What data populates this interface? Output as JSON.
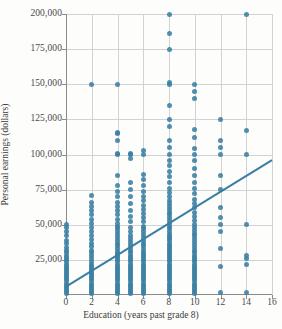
{
  "chart_data": {
    "type": "scatter",
    "title": "",
    "xlabel": "Education (years past grade 8)",
    "ylabel": "Personal earnings (dollars)",
    "xlim": [
      0,
      16
    ],
    "ylim": [
      0,
      200000
    ],
    "xticks": [
      0,
      2,
      4,
      6,
      8,
      10,
      12,
      14,
      16
    ],
    "xticklabels": [
      "0",
      "2",
      "4",
      "6",
      "8",
      "10",
      "12",
      "14",
      "16"
    ],
    "yticks": [
      25000,
      50000,
      75000,
      100000,
      125000,
      150000,
      175000,
      200000
    ],
    "yticklabels": [
      "25,000",
      "50,000",
      "75,000",
      "100,000",
      "125,000",
      "150,000",
      "175,000",
      "200,000"
    ],
    "grid": true,
    "legend": false,
    "marker_color": "#3a7fa3",
    "trendline_color": "#3a7fa3",
    "trendline": {
      "x_start": 0,
      "y_start": 6000,
      "x_end": 16,
      "y_end": 96000
    },
    "series": [
      {
        "name": "Personal earnings vs education",
        "points": [
          [
            0,
            1000
          ],
          [
            0,
            2500
          ],
          [
            0,
            4000
          ],
          [
            0,
            5500
          ],
          [
            0,
            7000
          ],
          [
            0,
            8500
          ],
          [
            0,
            10000
          ],
          [
            0,
            11500
          ],
          [
            0,
            13000
          ],
          [
            0,
            14500
          ],
          [
            0,
            16000
          ],
          [
            0,
            17500
          ],
          [
            0,
            19000
          ],
          [
            0,
            20500
          ],
          [
            0,
            22000
          ],
          [
            0,
            23500
          ],
          [
            0,
            25000
          ],
          [
            0,
            26500
          ],
          [
            0,
            28000
          ],
          [
            0,
            30000
          ],
          [
            0,
            32000
          ],
          [
            0,
            34000
          ],
          [
            0,
            36500
          ],
          [
            0,
            39000
          ],
          [
            0,
            42000
          ],
          [
            0,
            45000
          ],
          [
            0,
            48000
          ],
          [
            0,
            50000
          ],
          [
            2,
            1000
          ],
          [
            2,
            2500
          ],
          [
            2,
            4000
          ],
          [
            2,
            5500
          ],
          [
            2,
            7000
          ],
          [
            2,
            8500
          ],
          [
            2,
            10000
          ],
          [
            2,
            11500
          ],
          [
            2,
            13000
          ],
          [
            2,
            14500
          ],
          [
            2,
            16000
          ],
          [
            2,
            17500
          ],
          [
            2,
            19000
          ],
          [
            2,
            20500
          ],
          [
            2,
            22000
          ],
          [
            2,
            24000
          ],
          [
            2,
            26000
          ],
          [
            2,
            28000
          ],
          [
            2,
            30000
          ],
          [
            2,
            32000
          ],
          [
            2,
            34500
          ],
          [
            2,
            37000
          ],
          [
            2,
            39500
          ],
          [
            2,
            42000
          ],
          [
            2,
            45000
          ],
          [
            2,
            48000
          ],
          [
            2,
            51000
          ],
          [
            2,
            54000
          ],
          [
            2,
            57000
          ],
          [
            2,
            60000
          ],
          [
            2,
            63000
          ],
          [
            2,
            66000
          ],
          [
            2,
            71000
          ],
          [
            2,
            150000
          ],
          [
            4,
            1000
          ],
          [
            4,
            2500
          ],
          [
            4,
            4000
          ],
          [
            4,
            5500
          ],
          [
            4,
            7000
          ],
          [
            4,
            8500
          ],
          [
            4,
            10000
          ],
          [
            4,
            11500
          ],
          [
            4,
            13000
          ],
          [
            4,
            14500
          ],
          [
            4,
            16000
          ],
          [
            4,
            17500
          ],
          [
            4,
            19000
          ],
          [
            4,
            20500
          ],
          [
            4,
            22000
          ],
          [
            4,
            23500
          ],
          [
            4,
            25000
          ],
          [
            4,
            26500
          ],
          [
            4,
            28000
          ],
          [
            4,
            29500
          ],
          [
            4,
            31000
          ],
          [
            4,
            33000
          ],
          [
            4,
            35000
          ],
          [
            4,
            37000
          ],
          [
            4,
            39000
          ],
          [
            4,
            41000
          ],
          [
            4,
            43000
          ],
          [
            4,
            45000
          ],
          [
            4,
            47000
          ],
          [
            4,
            49000
          ],
          [
            4,
            51000
          ],
          [
            4,
            54000
          ],
          [
            4,
            57000
          ],
          [
            4,
            60000
          ],
          [
            4,
            63000
          ],
          [
            4,
            66000
          ],
          [
            4,
            70000
          ],
          [
            4,
            74000
          ],
          [
            4,
            78000
          ],
          [
            4,
            85000
          ],
          [
            4,
            100000
          ],
          [
            4,
            101000
          ],
          [
            4,
            110000
          ],
          [
            4,
            115000
          ],
          [
            4,
            116000
          ],
          [
            4,
            150000
          ],
          [
            5,
            1000
          ],
          [
            5,
            2500
          ],
          [
            5,
            4000
          ],
          [
            5,
            5500
          ],
          [
            5,
            7000
          ],
          [
            5,
            8500
          ],
          [
            5,
            10000
          ],
          [
            5,
            11500
          ],
          [
            5,
            13000
          ],
          [
            5,
            14500
          ],
          [
            5,
            16000
          ],
          [
            5,
            17500
          ],
          [
            5,
            19000
          ],
          [
            5,
            20500
          ],
          [
            5,
            22000
          ],
          [
            5,
            23500
          ],
          [
            5,
            25000
          ],
          [
            5,
            26500
          ],
          [
            5,
            28000
          ],
          [
            5,
            30000
          ],
          [
            5,
            32000
          ],
          [
            5,
            34000
          ],
          [
            5,
            36000
          ],
          [
            5,
            38000
          ],
          [
            5,
            40000
          ],
          [
            5,
            42000
          ],
          [
            5,
            45000
          ],
          [
            5,
            48000
          ],
          [
            5,
            52000
          ],
          [
            5,
            56000
          ],
          [
            5,
            60000
          ],
          [
            5,
            65000
          ],
          [
            5,
            70000
          ],
          [
            5,
            75000
          ],
          [
            5,
            80000
          ],
          [
            5,
            97000
          ],
          [
            5,
            100000
          ],
          [
            5,
            101000
          ],
          [
            6,
            1000
          ],
          [
            6,
            2500
          ],
          [
            6,
            4000
          ],
          [
            6,
            5500
          ],
          [
            6,
            7000
          ],
          [
            6,
            8500
          ],
          [
            6,
            10000
          ],
          [
            6,
            11500
          ],
          [
            6,
            13000
          ],
          [
            6,
            14500
          ],
          [
            6,
            16000
          ],
          [
            6,
            17500
          ],
          [
            6,
            19000
          ],
          [
            6,
            20500
          ],
          [
            6,
            22000
          ],
          [
            6,
            23500
          ],
          [
            6,
            25000
          ],
          [
            6,
            26500
          ],
          [
            6,
            28000
          ],
          [
            6,
            29500
          ],
          [
            6,
            31000
          ],
          [
            6,
            33000
          ],
          [
            6,
            35000
          ],
          [
            6,
            37000
          ],
          [
            6,
            39000
          ],
          [
            6,
            41000
          ],
          [
            6,
            43000
          ],
          [
            6,
            45000
          ],
          [
            6,
            47000
          ],
          [
            6,
            49000
          ],
          [
            6,
            52000
          ],
          [
            6,
            55000
          ],
          [
            6,
            58000
          ],
          [
            6,
            61000
          ],
          [
            6,
            64000
          ],
          [
            6,
            67000
          ],
          [
            6,
            70000
          ],
          [
            6,
            74000
          ],
          [
            6,
            78000
          ],
          [
            6,
            82000
          ],
          [
            6,
            86000
          ],
          [
            6,
            100000
          ],
          [
            6,
            103000
          ],
          [
            8,
            1000
          ],
          [
            8,
            2500
          ],
          [
            8,
            4000
          ],
          [
            8,
            5500
          ],
          [
            8,
            7000
          ],
          [
            8,
            8500
          ],
          [
            8,
            10000
          ],
          [
            8,
            11500
          ],
          [
            8,
            13000
          ],
          [
            8,
            14500
          ],
          [
            8,
            16000
          ],
          [
            8,
            17500
          ],
          [
            8,
            19000
          ],
          [
            8,
            20500
          ],
          [
            8,
            22000
          ],
          [
            8,
            23500
          ],
          [
            8,
            25000
          ],
          [
            8,
            26500
          ],
          [
            8,
            28000
          ],
          [
            8,
            29500
          ],
          [
            8,
            31000
          ],
          [
            8,
            32500
          ],
          [
            8,
            34000
          ],
          [
            8,
            35500
          ],
          [
            8,
            37000
          ],
          [
            8,
            38500
          ],
          [
            8,
            40000
          ],
          [
            8,
            41500
          ],
          [
            8,
            43000
          ],
          [
            8,
            45000
          ],
          [
            8,
            47000
          ],
          [
            8,
            49000
          ],
          [
            8,
            51000
          ],
          [
            8,
            53000
          ],
          [
            8,
            55000
          ],
          [
            8,
            57000
          ],
          [
            8,
            59000
          ],
          [
            8,
            61000
          ],
          [
            8,
            63000
          ],
          [
            8,
            65000
          ],
          [
            8,
            67000
          ],
          [
            8,
            70000
          ],
          [
            8,
            73000
          ],
          [
            8,
            76000
          ],
          [
            8,
            80000
          ],
          [
            8,
            84000
          ],
          [
            8,
            88000
          ],
          [
            8,
            92000
          ],
          [
            8,
            96000
          ],
          [
            8,
            100000
          ],
          [
            8,
            105000
          ],
          [
            8,
            110000
          ],
          [
            8,
            120000
          ],
          [
            8,
            125000
          ],
          [
            8,
            135000
          ],
          [
            8,
            150000
          ],
          [
            8,
            151000
          ],
          [
            8,
            175000
          ],
          [
            8,
            186000
          ],
          [
            8,
            200000
          ],
          [
            10,
            1000
          ],
          [
            10,
            2500
          ],
          [
            10,
            4000
          ],
          [
            10,
            5500
          ],
          [
            10,
            7000
          ],
          [
            10,
            8500
          ],
          [
            10,
            10000
          ],
          [
            10,
            11500
          ],
          [
            10,
            13000
          ],
          [
            10,
            14500
          ],
          [
            10,
            16000
          ],
          [
            10,
            17500
          ],
          [
            10,
            19000
          ],
          [
            10,
            20500
          ],
          [
            10,
            22000
          ],
          [
            10,
            23500
          ],
          [
            10,
            25000
          ],
          [
            10,
            26500
          ],
          [
            10,
            28000
          ],
          [
            10,
            30000
          ],
          [
            10,
            32000
          ],
          [
            10,
            34000
          ],
          [
            10,
            36000
          ],
          [
            10,
            38000
          ],
          [
            10,
            40000
          ],
          [
            10,
            42000
          ],
          [
            10,
            44000
          ],
          [
            10,
            46000
          ],
          [
            10,
            48000
          ],
          [
            10,
            50000
          ],
          [
            10,
            53000
          ],
          [
            10,
            56000
          ],
          [
            10,
            59000
          ],
          [
            10,
            62000
          ],
          [
            10,
            65000
          ],
          [
            10,
            68000
          ],
          [
            10,
            72000
          ],
          [
            10,
            76000
          ],
          [
            10,
            80000
          ],
          [
            10,
            85000
          ],
          [
            10,
            90000
          ],
          [
            10,
            96000
          ],
          [
            10,
            100000
          ],
          [
            10,
            104000
          ],
          [
            10,
            112000
          ],
          [
            10,
            118000
          ],
          [
            10,
            140000
          ],
          [
            10,
            145000
          ],
          [
            10,
            150000
          ],
          [
            12,
            2000
          ],
          [
            12,
            20000
          ],
          [
            12,
            33000
          ],
          [
            12,
            45000
          ],
          [
            12,
            50000
          ],
          [
            12,
            55000
          ],
          [
            12,
            62000
          ],
          [
            12,
            75000
          ],
          [
            12,
            85000
          ],
          [
            12,
            100000
          ],
          [
            12,
            105000
          ],
          [
            12,
            110000
          ],
          [
            12,
            125000
          ],
          [
            14,
            2000
          ],
          [
            14,
            22000
          ],
          [
            14,
            26000
          ],
          [
            14,
            28000
          ],
          [
            14,
            50000
          ],
          [
            14,
            100000
          ],
          [
            14,
            117000
          ],
          [
            14,
            200000
          ]
        ]
      }
    ]
  }
}
